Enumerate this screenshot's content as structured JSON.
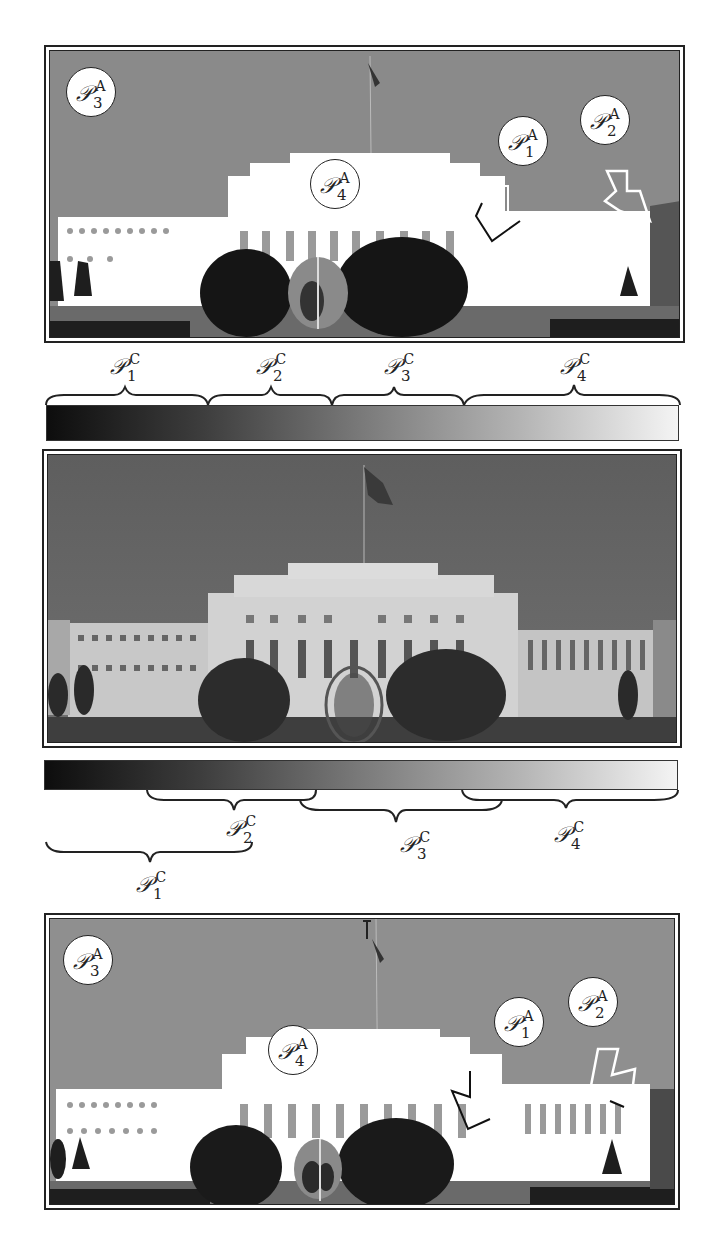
{
  "figure": {
    "panels": [
      {
        "id": "top-segmented",
        "description": "Segmented (quantized) version of building photo",
        "regions": [
          {
            "name": "P",
            "sub": "3",
            "sup": "A",
            "target": "sky"
          },
          {
            "name": "P",
            "sub": "4",
            "sup": "A",
            "target": "building facade"
          },
          {
            "name": "P",
            "sub": "1",
            "sup": "A",
            "target": "dark tree"
          },
          {
            "name": "P",
            "sub": "2",
            "sup": "A",
            "target": "right wing"
          }
        ]
      },
      {
        "id": "middle-original",
        "description": "Original grayscale photo of building with flag, trees and sphere"
      },
      {
        "id": "bottom-segmented",
        "description": "Segmented version with overlapping color partitions",
        "regions": [
          {
            "name": "P",
            "sub": "3",
            "sup": "A",
            "target": "sky"
          },
          {
            "name": "P",
            "sub": "4",
            "sup": "A",
            "target": "building facade"
          },
          {
            "name": "P",
            "sub": "1",
            "sup": "A",
            "target": "dark tree"
          },
          {
            "name": "P",
            "sub": "2",
            "sup": "A",
            "target": "right wing"
          }
        ]
      }
    ],
    "top_partition": {
      "type": "disjoint",
      "labels": [
        {
          "name": "P",
          "sub": "1",
          "sup": "C"
        },
        {
          "name": "P",
          "sub": "2",
          "sup": "C"
        },
        {
          "name": "P",
          "sub": "3",
          "sup": "C"
        },
        {
          "name": "P",
          "sub": "4",
          "sup": "C"
        }
      ]
    },
    "bottom_partition": {
      "type": "overlapping",
      "labels": [
        {
          "name": "P",
          "sub": "2",
          "sup": "C"
        },
        {
          "name": "P",
          "sub": "3",
          "sup": "C"
        },
        {
          "name": "P",
          "sub": "4",
          "sup": "C"
        },
        {
          "name": "P",
          "sub": "1",
          "sup": "C"
        }
      ]
    },
    "colors": {
      "sky_seg": "#8a8a8a",
      "building_seg": "#ffffff",
      "tree_seg": "#151515",
      "mid_gray": "#9a9a9a",
      "frame": "#222222"
    }
  }
}
